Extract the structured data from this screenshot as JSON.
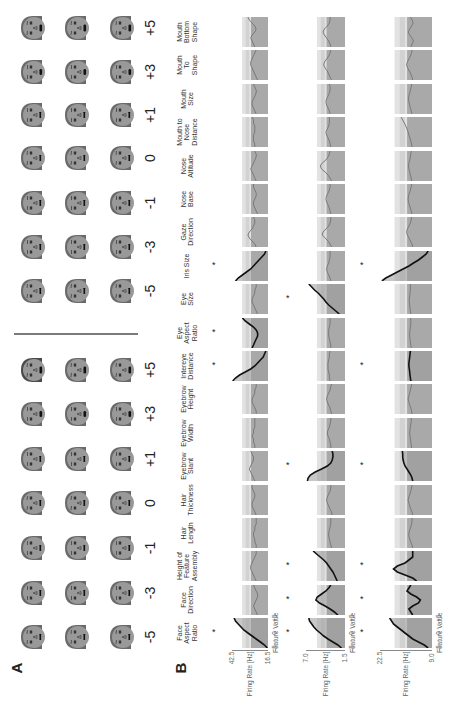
{
  "figure": {
    "panel_a_label": "A",
    "panel_b_label": "B",
    "feature_values": [
      "-5",
      "-3",
      "-1",
      "0",
      "+1",
      "+3",
      "+5"
    ],
    "features": [
      {
        "name": "Face Aspect Ratio",
        "lines": [
          "Face",
          "Aspect",
          "Ratio"
        ]
      },
      {
        "name": "Face Direction",
        "lines": [
          "Face",
          "Direction"
        ]
      },
      {
        "name": "Height of Feature Assembly",
        "lines": [
          "Height of",
          "Feature",
          "Assembly"
        ]
      },
      {
        "name": "Hair Length",
        "lines": [
          "Hair",
          "Length"
        ]
      },
      {
        "name": "Hair Thickness",
        "lines": [
          "Hair",
          "Thickness"
        ]
      },
      {
        "name": "Eyebrow Slant",
        "lines": [
          "Eyebrow",
          "Slant"
        ]
      },
      {
        "name": "Eyebrow Width",
        "lines": [
          "Eyebrow",
          "Width"
        ]
      },
      {
        "name": "Eyebrow Height",
        "lines": [
          "Eyebrow",
          "Height"
        ]
      },
      {
        "name": "Intereye Distance",
        "lines": [
          "Intereye",
          "Distance"
        ]
      },
      {
        "name": "Eye Aspect Ratio",
        "lines": [
          "Eye",
          "Aspect",
          "Ratio"
        ]
      },
      {
        "name": "Eye Size",
        "lines": [
          "Eye",
          "Size"
        ]
      },
      {
        "name": "Iris Size",
        "lines": [
          "Iris Size"
        ]
      },
      {
        "name": "Gaze Direction",
        "lines": [
          "Gaze",
          "Direction"
        ]
      },
      {
        "name": "Nose Base",
        "lines": [
          "Nose",
          "Base"
        ]
      },
      {
        "name": "Nose Altitude",
        "lines": [
          "Nose",
          "Altitude"
        ]
      },
      {
        "name": "Mouth to Nose Distance",
        "lines": [
          "Mouth to",
          "Nose",
          "Distance"
        ]
      },
      {
        "name": "Mouth Size",
        "lines": [
          "Mouth",
          "Size"
        ]
      },
      {
        "name": "Mouth To Shape",
        "lines": [
          "Mouth",
          "To",
          "Shape"
        ]
      },
      {
        "name": "Mouth Bottom Shape",
        "lines": [
          "Mouth",
          "Bottom",
          "Shape"
        ]
      }
    ],
    "axes": {
      "ylabel": "Firing Rate [Hz]",
      "xlabel": "Feature Value",
      "xticks": [
        "-5",
        "0",
        "+5"
      ],
      "rows": [
        {
          "ymax": "42.5",
          "ymin": "16.5"
        },
        {
          "ymax": "7.0",
          "ymin": "1.5"
        },
        {
          "ymax": "22.5",
          "ymin": "9.0"
        }
      ]
    },
    "significance_marker": "*"
  },
  "chart_data": {
    "type": "line",
    "xlabel": "Feature Value",
    "ylabel": "Firing Rate [Hz]",
    "x": [
      -5,
      -4,
      -3,
      -2,
      -1,
      0,
      1,
      2,
      3,
      4,
      5
    ],
    "categories": [
      "Face Aspect Ratio",
      "Face Direction",
      "Height of Feature Assembly",
      "Hair Length",
      "Hair Thickness",
      "Eyebrow Slant",
      "Eyebrow Width",
      "Eyebrow Height",
      "Intereye Distance",
      "Eye Aspect Ratio",
      "Eye Size",
      "Iris Size",
      "Gaze Direction",
      "Nose Base",
      "Nose Altitude",
      "Mouth to Nose Distance",
      "Mouth Size",
      "Mouth To Shape",
      "Mouth Bottom Shape"
    ],
    "series": [
      {
        "name": "Neuron 1",
        "ylim": [
          16.5,
          42.5
        ],
        "significant": [
          "Face Aspect Ratio",
          "Intereye Distance",
          "Eye Aspect Ratio",
          "Iris Size"
        ],
        "curves": {
          "Face Aspect Ratio": [
            17,
            19,
            22,
            25,
            28,
            31,
            34,
            36,
            38,
            40,
            41
          ],
          "Face Direction": [
            24,
            25,
            26,
            27,
            26,
            25,
            24,
            24,
            25,
            26,
            27
          ],
          "Height of Feature Assembly": [
            25,
            26,
            27,
            28,
            29,
            29,
            28,
            27,
            26,
            25,
            25
          ],
          "Hair Length": [
            25,
            25,
            26,
            26,
            27,
            27,
            26,
            26,
            25,
            25,
            25
          ],
          "Hair Thickness": [
            25,
            26,
            27,
            28,
            28,
            27,
            26,
            26,
            27,
            28,
            28
          ],
          "Eyebrow Slant": [
            26,
            27,
            28,
            29,
            30,
            29,
            28,
            27,
            27,
            28,
            29
          ],
          "Eyebrow Width": [
            26,
            26,
            27,
            27,
            28,
            27,
            27,
            26,
            26,
            26,
            26
          ],
          "Eyebrow Height": [
            25,
            25,
            26,
            27,
            28,
            28,
            27,
            26,
            26,
            25,
            25
          ],
          "Intereye Distance": [
            42,
            40,
            37,
            33,
            29,
            26,
            24,
            22,
            20,
            19,
            18
          ],
          "Eye Aspect Ratio": [
            28,
            27,
            26,
            25,
            24,
            24,
            25,
            27,
            30,
            33,
            35
          ],
          "Eye Size": [
            24,
            25,
            26,
            27,
            28,
            28,
            27,
            26,
            26,
            25,
            25
          ],
          "Iris Size": [
            40,
            38,
            35,
            32,
            29,
            27,
            25,
            23,
            21,
            19,
            18
          ],
          "Gaze Direction": [
            25,
            26,
            28,
            30,
            31,
            30,
            28,
            27,
            26,
            26,
            27
          ],
          "Nose Base": [
            24,
            25,
            26,
            27,
            27,
            26,
            25,
            25,
            26,
            27,
            27
          ],
          "Nose Altitude": [
            25,
            26,
            27,
            28,
            29,
            28,
            27,
            26,
            25,
            25,
            26
          ],
          "Mouth to Nose Distance": [
            26,
            26,
            27,
            27,
            27,
            26,
            26,
            26,
            27,
            27,
            28
          ],
          "Mouth Size": [
            25,
            26,
            27,
            28,
            28,
            27,
            26,
            25,
            25,
            26,
            27
          ],
          "Mouth To Shape": [
            24,
            25,
            26,
            27,
            28,
            29,
            29,
            28,
            27,
            26,
            25
          ],
          "Mouth Bottom Shape": [
            26,
            27,
            28,
            29,
            28,
            26,
            25,
            26,
            28,
            30,
            31
          ]
        }
      },
      {
        "name": "Neuron 2",
        "ylim": [
          1.5,
          7.0
        ],
        "significant": [
          "Face Aspect Ratio",
          "Face Direction",
          "Height of Feature Assembly",
          "Eyebrow Slant",
          "Eye Size"
        ],
        "curves": {
          "Face Aspect Ratio": [
            2.0,
            2.5,
            3.2,
            3.9,
            4.5,
            5.0,
            5.5,
            5.9,
            6.2,
            6.5,
            6.6
          ],
          "Face Direction": [
            2.5,
            3.0,
            3.6,
            4.3,
            5.1,
            5.6,
            5.4,
            4.8,
            4.2,
            3.8,
            3.5
          ],
          "Height of Feature Assembly": [
            2.6,
            2.8,
            3.0,
            3.2,
            3.5,
            3.8,
            4.1,
            4.5,
            5.0,
            5.5,
            6.0
          ],
          "Hair Length": [
            3.4,
            3.5,
            3.6,
            3.7,
            3.8,
            3.8,
            3.7,
            3.6,
            3.5,
            3.5,
            3.5
          ],
          "Hair Thickness": [
            3.3,
            3.4,
            3.6,
            3.8,
            4.0,
            4.1,
            4.0,
            3.8,
            3.6,
            3.5,
            3.5
          ],
          "Eyebrow Slant": [
            6.8,
            6.7,
            6.4,
            5.7,
            4.8,
            4.0,
            3.5,
            3.3,
            3.2,
            3.2,
            3.3
          ],
          "Eyebrow Width": [
            3.5,
            3.5,
            3.6,
            3.7,
            3.9,
            4.0,
            3.9,
            3.7,
            3.6,
            3.5,
            3.5
          ],
          "Eyebrow Height": [
            3.4,
            3.5,
            3.6,
            3.8,
            4.0,
            4.1,
            4.0,
            3.8,
            3.6,
            3.5,
            3.4
          ],
          "Intereye Distance": [
            3.6,
            3.7,
            3.7,
            3.8,
            3.9,
            3.9,
            3.9,
            3.8,
            3.7,
            3.7,
            3.6
          ],
          "Eye Aspect Ratio": [
            3.5,
            3.5,
            3.6,
            3.7,
            3.8,
            3.8,
            3.8,
            3.7,
            3.6,
            3.6,
            3.6
          ],
          "Eye Size": [
            2.3,
            2.8,
            3.3,
            3.8,
            4.2,
            4.5,
            4.9,
            5.3,
            5.8,
            6.2,
            6.6
          ],
          "Iris Size": [
            3.5,
            3.6,
            3.8,
            4.0,
            4.1,
            4.0,
            3.8,
            3.7,
            3.6,
            3.6,
            3.6
          ],
          "Gaze Direction": [
            3.4,
            3.6,
            3.9,
            4.3,
            4.7,
            4.6,
            4.2,
            3.8,
            3.6,
            3.5,
            3.5
          ],
          "Nose Base": [
            3.5,
            3.6,
            3.7,
            3.9,
            4.1,
            4.2,
            4.1,
            3.9,
            3.7,
            3.6,
            3.6
          ],
          "Nose Altitude": [
            3.4,
            3.6,
            3.9,
            4.3,
            4.8,
            5.0,
            4.7,
            4.2,
            3.9,
            3.7,
            3.6
          ],
          "Mouth to Nose Distance": [
            3.5,
            3.6,
            3.7,
            3.9,
            4.1,
            4.2,
            4.0,
            3.8,
            3.7,
            3.7,
            3.7
          ],
          "Mouth Size": [
            3.6,
            3.7,
            3.9,
            4.1,
            4.2,
            4.1,
            3.9,
            3.7,
            3.6,
            3.6,
            3.7
          ],
          "Mouth To Shape": [
            3.4,
            3.6,
            3.8,
            4.0,
            4.3,
            4.5,
            4.4,
            4.1,
            3.8,
            3.6,
            3.5
          ],
          "Mouth Bottom Shape": [
            3.5,
            3.6,
            3.8,
            4.1,
            4.4,
            4.6,
            4.4,
            4.0,
            3.7,
            3.6,
            3.6
          ]
        }
      },
      {
        "name": "Neuron 3",
        "ylim": [
          9.0,
          22.5
        ],
        "significant": [
          "Face Aspect Ratio",
          "Face Direction",
          "Height of Feature Assembly",
          "Eyebrow Slant",
          "Intereye Distance",
          "Iris Size"
        ],
        "curves": {
          "Face Aspect Ratio": [
            10,
            11,
            12.5,
            14,
            15,
            16,
            17,
            18,
            19,
            19.5,
            20
          ],
          "Face Direction": [
            14,
            14.5,
            15,
            14,
            12.5,
            12,
            13,
            14.5,
            15.5,
            15,
            14.5
          ],
          "Height of Feature Assembly": [
            13,
            14,
            16,
            18,
            19,
            18,
            16,
            15,
            14,
            14,
            14
          ],
          "Hair Length": [
            14,
            14.2,
            14.5,
            14.8,
            15,
            15,
            14.8,
            14.5,
            14.3,
            14.2,
            14.2
          ],
          "Hair Thickness": [
            14,
            14.2,
            14.5,
            14.8,
            15,
            15.2,
            15,
            14.7,
            14.5,
            14.3,
            14.2
          ],
          "Eyebrow Slant": [
            14,
            14.2,
            14.5,
            15,
            15.5,
            16,
            16.3,
            16.5,
            16.6,
            16.6,
            16.7
          ],
          "Eyebrow Width": [
            14.3,
            14.4,
            14.5,
            14.6,
            14.7,
            14.8,
            14.7,
            14.6,
            14.5,
            14.4,
            14.4
          ],
          "Eyebrow Height": [
            14.2,
            14.3,
            14.5,
            14.8,
            15,
            15.2,
            15,
            14.8,
            14.6,
            14.4,
            14.3
          ],
          "Intereye Distance": [
            14.5,
            14.6,
            14.7,
            14.8,
            14.9,
            15,
            15,
            14.9,
            14.8,
            14.7,
            14.6
          ],
          "Eye Aspect Ratio": [
            14.4,
            14.5,
            14.6,
            14.7,
            14.8,
            14.8,
            14.7,
            14.6,
            14.5,
            14.5,
            14.5
          ],
          "Eye Size": [
            14.5,
            14.6,
            14.7,
            14.8,
            14.9,
            14.9,
            14.8,
            14.7,
            14.6,
            14.6,
            14.6
          ],
          "Iris Size": [
            22,
            21,
            19.5,
            18,
            16.5,
            15,
            13.8,
            12.5,
            11.5,
            10.5,
            10
          ],
          "Gaze Direction": [
            14,
            14.2,
            14.6,
            15,
            15.4,
            15.6,
            15.4,
            15,
            14.6,
            14.4,
            14.3
          ],
          "Nose Base": [
            14.2,
            14.4,
            14.6,
            14.9,
            15.1,
            15.2,
            15.1,
            14.9,
            14.6,
            14.4,
            14.3
          ],
          "Nose Altitude": [
            14.3,
            14.4,
            14.6,
            14.8,
            15,
            15.1,
            15,
            14.8,
            14.6,
            14.5,
            14.4
          ],
          "Mouth to Nose Distance": [
            14.2,
            14.3,
            14.5,
            14.7,
            15,
            15.2,
            15.5,
            15.8,
            16.2,
            16.6,
            17
          ],
          "Mouth Size": [
            14.2,
            14.4,
            14.6,
            14.8,
            15,
            15.1,
            15,
            14.8,
            14.6,
            14.4,
            14.3
          ],
          "Mouth To Shape": [
            14,
            14.2,
            14.5,
            14.9,
            15.3,
            15.6,
            15.4,
            15,
            14.6,
            14.3,
            14.2
          ],
          "Mouth Bottom Shape": [
            14.5,
            14.2,
            13.8,
            14.2,
            14.8,
            15.2,
            14.8,
            14.3,
            13.9,
            14.2,
            14.6
          ]
        }
      }
    ]
  }
}
